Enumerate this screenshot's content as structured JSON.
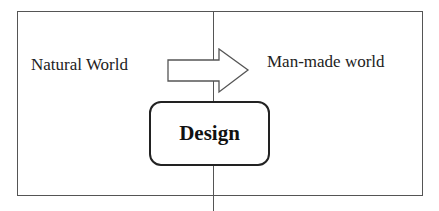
{
  "diagram": {
    "left_label": "Natural World",
    "right_label": "Man-made world",
    "center_box_label": "Design",
    "arrow_direction": "right",
    "colors": {
      "lines": "#555555",
      "text": "#222222",
      "background": "#ffffff"
    }
  }
}
